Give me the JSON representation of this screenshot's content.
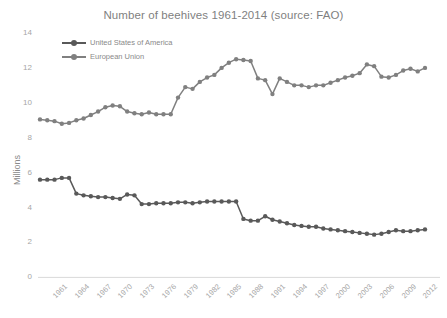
{
  "chart_data": {
    "type": "line",
    "title": "Number of beehives 1961-2014 (source: FAO)",
    "xlabel": "",
    "ylabel": "Millions",
    "ylim": [
      0,
      14
    ],
    "ytick_labels": [
      "0",
      "2",
      "4",
      "6",
      "8",
      "10",
      "12",
      "14"
    ],
    "yticks": [
      0,
      2,
      4,
      6,
      8,
      10,
      12,
      14
    ],
    "xlim": [
      1961,
      2014
    ],
    "xtick_labels": [
      "1961",
      "1964",
      "1967",
      "1970",
      "1973",
      "1976",
      "1979",
      "1982",
      "1985",
      "1988",
      "1991",
      "1994",
      "1997",
      "2000",
      "2003",
      "2006",
      "2009",
      "2012"
    ],
    "xticks": [
      1961,
      1964,
      1967,
      1970,
      1973,
      1976,
      1979,
      1982,
      1985,
      1988,
      1991,
      1994,
      1997,
      2000,
      2003,
      2006,
      2009,
      2012
    ],
    "grid": false,
    "legend_position": "upper-left-inside",
    "markers": true,
    "x": [
      1961,
      1962,
      1963,
      1964,
      1965,
      1966,
      1967,
      1968,
      1969,
      1970,
      1971,
      1972,
      1973,
      1974,
      1975,
      1976,
      1977,
      1978,
      1979,
      1980,
      1981,
      1982,
      1983,
      1984,
      1985,
      1986,
      1987,
      1988,
      1989,
      1990,
      1991,
      1992,
      1993,
      1994,
      1995,
      1996,
      1997,
      1998,
      1999,
      2000,
      2001,
      2002,
      2003,
      2004,
      2005,
      2006,
      2007,
      2008,
      2009,
      2010,
      2011,
      2012,
      2013,
      2014
    ],
    "series": [
      {
        "name": "United States of America",
        "color": "#595959",
        "values": [
          5.6,
          5.6,
          5.6,
          5.7,
          5.7,
          4.8,
          4.7,
          4.65,
          4.6,
          4.6,
          4.55,
          4.5,
          4.75,
          4.7,
          4.2,
          4.2,
          4.25,
          4.25,
          4.25,
          4.3,
          4.3,
          4.25,
          4.3,
          4.35,
          4.35,
          4.35,
          4.35,
          4.35,
          3.35,
          3.25,
          3.25,
          3.5,
          3.3,
          3.2,
          3.1,
          3.0,
          2.95,
          2.9,
          2.9,
          2.8,
          2.75,
          2.7,
          2.65,
          2.6,
          2.55,
          2.5,
          2.45,
          2.5,
          2.6,
          2.7,
          2.65,
          2.65,
          2.7,
          2.75
        ]
      },
      {
        "name": "European Union",
        "color": "#808080",
        "values": [
          9.05,
          9.0,
          8.95,
          8.8,
          8.85,
          9.0,
          9.1,
          9.3,
          9.5,
          9.75,
          9.85,
          9.8,
          9.5,
          9.4,
          9.35,
          9.45,
          9.35,
          9.35,
          9.35,
          10.3,
          10.9,
          10.8,
          11.2,
          11.45,
          11.6,
          12.0,
          12.3,
          12.5,
          12.45,
          12.4,
          11.4,
          11.3,
          10.5,
          11.4,
          11.2,
          11.0,
          11.0,
          10.9,
          11.0,
          11.0,
          11.15,
          11.3,
          11.45,
          11.55,
          11.7,
          12.2,
          12.1,
          11.5,
          11.45,
          11.6,
          11.85,
          11.95,
          11.8,
          12.0
        ]
      }
    ]
  }
}
